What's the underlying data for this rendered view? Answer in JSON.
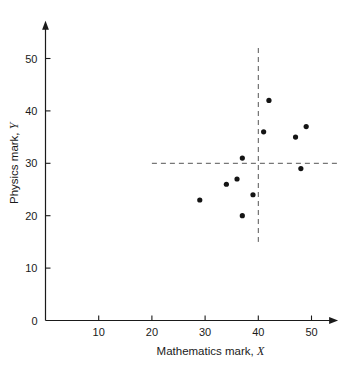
{
  "chart_data": {
    "type": "scatter",
    "title": "",
    "subtitle": "",
    "xlabel": "Mathematics mark,",
    "xlabel_variable": "X",
    "ylabel": "Physics mark,",
    "ylabel_variable": "Y",
    "xlim": [
      0,
      55
    ],
    "ylim": [
      0,
      55
    ],
    "xticks": [
      10,
      20,
      30,
      40,
      50
    ],
    "ytick_labels": [
      "10",
      "20",
      "30",
      "40",
      "50"
    ],
    "xtick_labels": [
      "10",
      "20",
      "30",
      "40",
      "50"
    ],
    "yticks": [
      10,
      20,
      30,
      40,
      50
    ],
    "origin_label": "0",
    "grid": false,
    "legend": false,
    "legend_position": "none",
    "axis_arrows": true,
    "point_color": "#141414",
    "point_radius": 2.6,
    "reference_lines": [
      {
        "name": "mean-x-line",
        "orientation": "vertical",
        "value": 40,
        "from": 15,
        "to": 52,
        "style": "dashed",
        "color": "#555555"
      },
      {
        "name": "mean-y-line",
        "orientation": "horizontal",
        "value": 30,
        "from": 20,
        "to": 55,
        "style": "dashed",
        "color": "#555555"
      }
    ],
    "series": [
      {
        "name": "students",
        "points": [
          {
            "x": 29,
            "y": 23
          },
          {
            "x": 34,
            "y": 26
          },
          {
            "x": 36,
            "y": 27
          },
          {
            "x": 37,
            "y": 20
          },
          {
            "x": 37,
            "y": 31
          },
          {
            "x": 39,
            "y": 24
          },
          {
            "x": 41,
            "y": 36
          },
          {
            "x": 42,
            "y": 42
          },
          {
            "x": 47,
            "y": 35
          },
          {
            "x": 48,
            "y": 29
          },
          {
            "x": 49,
            "y": 37
          }
        ]
      }
    ]
  }
}
